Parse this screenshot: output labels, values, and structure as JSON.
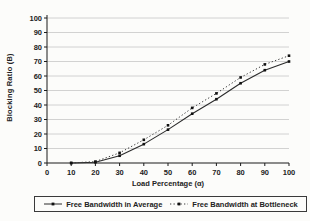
{
  "chart_data": {
    "type": "line",
    "title": "",
    "xlabel": "Load Percentage (α)",
    "ylabel": "Blocking Ratio (B)",
    "xlim": [
      0,
      100
    ],
    "ylim": [
      0,
      100
    ],
    "xticks": [
      0,
      10,
      20,
      30,
      40,
      50,
      60,
      70,
      80,
      90,
      100
    ],
    "yticks": [
      0,
      10,
      20,
      30,
      40,
      50,
      60,
      70,
      80,
      90,
      100
    ],
    "grid": "horizontal",
    "legend_position": "bottom",
    "x": [
      10,
      20,
      30,
      40,
      50,
      60,
      70,
      80,
      90,
      100
    ],
    "series": [
      {
        "name": "Free Bandwidth in Average",
        "style": "solid",
        "marker": "dot",
        "color": "#2b2b2b",
        "values": [
          0,
          0.5,
          5,
          13,
          23,
          34,
          44,
          55,
          64,
          70
        ]
      },
      {
        "name": "Free Bandwidth at Bottleneck",
        "style": "dotted",
        "marker": "dot",
        "color": "#3c3c3c",
        "values": [
          0,
          1,
          7,
          16,
          26,
          38,
          48,
          59,
          68,
          74
        ]
      }
    ]
  },
  "colors": {
    "grid": "#c6c6c6",
    "axis": "#1a1a1a",
    "background": "#fcfcfa",
    "text": "#222222"
  }
}
